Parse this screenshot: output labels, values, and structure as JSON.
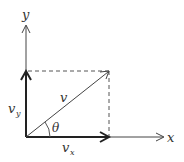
{
  "diagram": {
    "labels": {
      "x_axis": "x",
      "y_axis": "y",
      "vector": "v",
      "angle": "θ",
      "vx_main": "v",
      "vx_sub": "x",
      "vy_main": "v",
      "vy_sub": "y"
    },
    "colors": {
      "line": "#333333",
      "background": "#ffffff"
    }
  }
}
